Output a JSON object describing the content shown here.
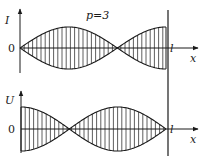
{
  "title": "p=3",
  "colors": {
    "ink": "#1a1a1a",
    "background": "#ffffff"
  },
  "top_plot": {
    "y_label": "I",
    "origin_label": "0",
    "end_label": "l",
    "x_label": "x",
    "envelope": "|sin(3πx/2l)|",
    "description": "Current amplitude: node at x=0 and x=2l/3, antinodes at x=l/3 and x=l"
  },
  "bottom_plot": {
    "y_label": "U",
    "origin_label": "0",
    "end_label": "l",
    "x_label": "x",
    "envelope": "|cos(3πx/2l)|",
    "description": "Voltage amplitude: antinodes at x=0 and x=2l/3, nodes at x=l/3 and x=l"
  },
  "geometry": {
    "x0": 20,
    "xl": 166,
    "wall_x": 168,
    "top_axis_y": 48,
    "top_amp": 21,
    "bottom_axis_y": 129,
    "bottom_amp": 22,
    "hatch_step": 4.2
  }
}
